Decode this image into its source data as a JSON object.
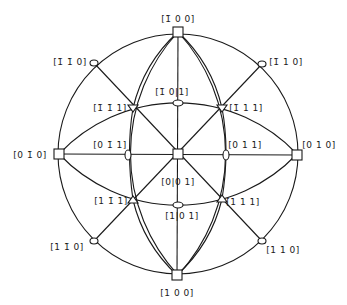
{
  "diagram": {
    "title": "",
    "type": "stereographic-projection",
    "center": [
      178,
      154
    ],
    "radius": 121,
    "poles": [
      {
        "id": "m100",
        "label": "[̅ 1 0 0]",
        "display": "[1̄ 0 0]",
        "x": 178,
        "y": 32,
        "shape": "square",
        "lx": 178,
        "ly": 22
      },
      {
        "id": "p100",
        "label": "[1 0 0]",
        "display": "[1 0 0]",
        "x": 177,
        "y": 275,
        "shape": "square",
        "lx": 177,
        "ly": 296
      },
      {
        "id": "m010",
        "label": "[0 1̄ 0]",
        "display": "[0 1̄ 0]",
        "x": 59,
        "y": 154,
        "shape": "square",
        "lx": 30,
        "ly": 158
      },
      {
        "id": "p010",
        "label": "[0 1 0]",
        "display": "[0 1 0]",
        "x": 297,
        "y": 155,
        "shape": "square",
        "lx": 319,
        "ly": 148
      },
      {
        "id": "p001",
        "label": "[0 0 1]",
        "display": "[0 0 1]",
        "x": 178,
        "y": 154,
        "shape": "square",
        "lx": 178,
        "ly": 185
      },
      {
        "id": "m1m10",
        "label": "[1̄ 1̄ 0]",
        "display": "[1̄ 1̄ 0]",
        "x": 94,
        "y": 63,
        "shape": "ellipse",
        "lx": 70,
        "ly": 65
      },
      {
        "id": "m110",
        "label": "[1̄ 1 0]",
        "display": "[1̄ 1 0]",
        "x": 262,
        "y": 64,
        "shape": "ellipse",
        "lx": 286,
        "ly": 65
      },
      {
        "id": "p1m10",
        "label": "[1 1̄ 0]",
        "display": "[1 1̄ 0]",
        "x": 94,
        "y": 241,
        "shape": "ellipse",
        "lx": 67,
        "ly": 250
      },
      {
        "id": "p110",
        "label": "[1 1 0]",
        "display": "[1 1 0]",
        "x": 262,
        "y": 241,
        "shape": "ellipse",
        "lx": 283,
        "ly": 253
      },
      {
        "id": "m101",
        "label": "[1̄ 0 1]",
        "display": "[1̄ 0 1]",
        "x": 178,
        "y": 103,
        "shape": "ellipse-h",
        "lx": 172,
        "ly": 95
      },
      {
        "id": "p101",
        "label": "[1 0 1]",
        "display": "[1 0 1]",
        "x": 178,
        "y": 205,
        "shape": "ellipse-h",
        "lx": 182,
        "ly": 219
      },
      {
        "id": "p0m11",
        "label": "[0 1̄ 1]",
        "display": "[0 1̄ 1]",
        "x": 128,
        "y": 155,
        "shape": "ellipse-v",
        "lx": 110,
        "ly": 148
      },
      {
        "id": "p011",
        "label": "[0 1 1]",
        "display": "[0 1 1]",
        "x": 226,
        "y": 155,
        "shape": "ellipse-v",
        "lx": 245,
        "ly": 148
      },
      {
        "id": "m1m11",
        "label": "[1̄ 1̄ 1]",
        "display": "[1̄ 1̄ 1]",
        "x": 133,
        "y": 108,
        "shape": "triangle",
        "lx": 110,
        "ly": 111
      },
      {
        "id": "m111",
        "label": "[1̄ 1 1]",
        "display": "[1̄ 1 1]",
        "x": 222,
        "y": 108,
        "shape": "triangle",
        "lx": 246,
        "ly": 111
      },
      {
        "id": "p1m11",
        "label": "[1 1̄ 1]",
        "display": "[1 1̄ 1]",
        "x": 133,
        "y": 200,
        "shape": "triangle",
        "lx": 111,
        "ly": 204
      },
      {
        "id": "p111",
        "label": "[1 1 1]",
        "display": "[1 1 1]",
        "x": 222,
        "y": 199,
        "shape": "triangle",
        "lx": 243,
        "ly": 205
      }
    ],
    "labels": {
      "m100": "[1̄ 0 0]",
      "p100": "[1 0 0]",
      "m010": "[0 1̄ 0]",
      "p010": "[0 1 0]",
      "p001": "[0|0 1]",
      "m1m10": "[1̄ 1̄ 0]",
      "m110": "[1̄ 1 0]",
      "p1m10": "[1 1̄ 0]",
      "p110": "[1 1 0]",
      "m101": "[1̄ 0|1]",
      "p101": "[1|0 1]",
      "p0m11": "[0 1̄ 1]",
      "p011": "[0 1 1]",
      "m1m11": "[1̄ 1̄ 1]",
      "m111": "[1̄ 1 1]",
      "p1m11": "[1 1̄ 1]",
      "p111": "[1 1 1]"
    },
    "line_color": "#1a1a1a",
    "background": "#ffffff"
  }
}
